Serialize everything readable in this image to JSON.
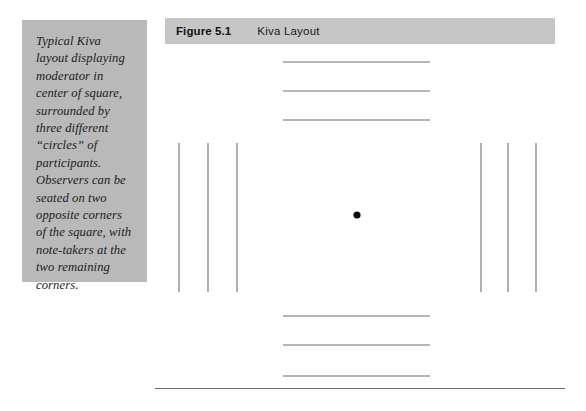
{
  "page": {
    "background_color": "#ffffff",
    "width": 586,
    "height": 411
  },
  "caption": {
    "panel_color": "#b9b9b9",
    "text": "Typical Kiva layout displaying moderator in center of square, surrounded by three different “circles” of participants. Observers can be seated on two opposite corners of the square, with note-takers at the two remaining corners."
  },
  "figure_header": {
    "bar_color": "#c6c6c6",
    "number": "Figure 5.1",
    "title": "Kiva Layout"
  },
  "diagram": {
    "stroke_color": "#6e6e6e",
    "moderator_dot_color": "#0d0d0d",
    "moderator_dot": {
      "cx": 357,
      "cy": 215,
      "r": 3.6
    },
    "top_rows": [
      {
        "x1": 283,
        "x2": 430,
        "y": 62
      },
      {
        "x1": 283,
        "x2": 430,
        "y": 91
      },
      {
        "x1": 283,
        "x2": 430,
        "y": 120
      }
    ],
    "bottom_rows": [
      {
        "x1": 283,
        "x2": 430,
        "y": 316
      },
      {
        "x1": 283,
        "x2": 430,
        "y": 345
      },
      {
        "x1": 283,
        "x2": 430,
        "y": 376
      }
    ],
    "left_rows": [
      {
        "x": 179,
        "y1": 143,
        "y2": 292
      },
      {
        "x": 208,
        "y1": 143,
        "y2": 292
      },
      {
        "x": 237,
        "y1": 143,
        "y2": 292
      }
    ],
    "right_rows": [
      {
        "x": 481,
        "y1": 143,
        "y2": 292
      },
      {
        "x": 508,
        "y1": 143,
        "y2": 292
      },
      {
        "x": 536,
        "y1": 143,
        "y2": 292
      }
    ]
  },
  "bottom_rule": {
    "color": "#6f6f6f",
    "x1": 155,
    "x2": 565,
    "y": 388
  }
}
